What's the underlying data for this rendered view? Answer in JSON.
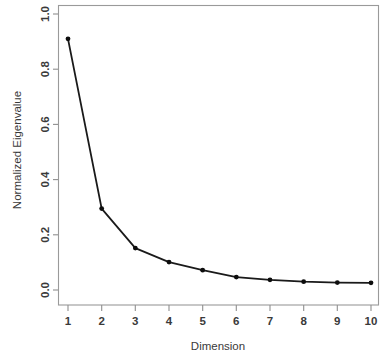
{
  "chart_data": {
    "type": "line",
    "title": "",
    "subtitle": "",
    "xlabel": "Dimension",
    "ylabel": "Normalized Eigenvalue",
    "x": [
      1,
      2,
      3,
      4,
      5,
      6,
      7,
      8,
      9,
      10
    ],
    "values": [
      0.91,
      0.295,
      0.152,
      0.101,
      0.072,
      0.047,
      0.037,
      0.03,
      0.027,
      0.026
    ],
    "series": [
      {
        "name": "Normalized Eigenvalue",
        "values": [
          0.91,
          0.295,
          0.152,
          0.101,
          0.072,
          0.047,
          0.037,
          0.03,
          0.027,
          0.026
        ]
      }
    ],
    "xtick_labels": [
      "1",
      "2",
      "3",
      "4",
      "5",
      "6",
      "7",
      "8",
      "9",
      "10"
    ],
    "ytick_labels": [
      "0.0",
      "0.2",
      "0.4",
      "0.6",
      "0.8",
      "1.0"
    ],
    "ytick_values": [
      0.0,
      0.2,
      0.4,
      0.6,
      0.8,
      1.0
    ],
    "xlim": [
      0.6,
      10.4
    ],
    "ylim": [
      -0.04,
      1.05
    ],
    "grid": false,
    "legend": false,
    "legend_position": "none",
    "marker": "filled-circle",
    "line_color": "#1a1a1a",
    "marker_color": "#0d0d0d",
    "frame_color": "#9a9a9a",
    "background_color": "#ffffff",
    "annotations": []
  },
  "axes": {
    "y_label_rotation": "-90",
    "x_axis_name": "x-axis",
    "y_axis_name": "y-axis"
  }
}
